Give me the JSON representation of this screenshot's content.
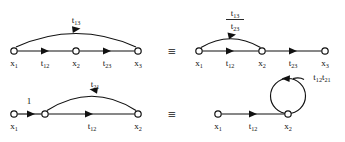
{
  "figure": {
    "background_color": "#ffffff",
    "line_color": "#111111",
    "equivalence_symbol": "≡"
  },
  "rows": [
    {
      "id": "row-top",
      "left_graph": {
        "id": "top-left-graph",
        "nodes": [
          {
            "id": "n1",
            "label_base": "x",
            "label_sub": "1",
            "cx": 14,
            "cy": 51
          },
          {
            "id": "n2",
            "label_base": "x",
            "label_sub": "2",
            "cx": 76,
            "cy": 51
          },
          {
            "id": "n3",
            "label_base": "x",
            "label_sub": "3",
            "cx": 138,
            "cy": 51
          }
        ],
        "edges": [
          {
            "id": "e-12",
            "kind": "straight",
            "label_base": "t",
            "label_sub": "12",
            "label_x": 45,
            "label_y": 66
          },
          {
            "id": "e-23",
            "kind": "straight",
            "label_base": "t",
            "label_sub": "23",
            "label_x": 107,
            "label_y": 66
          },
          {
            "id": "e-13",
            "kind": "arc",
            "label_base": "t",
            "label_sub": "13",
            "label_x": 76,
            "label_y": 23
          }
        ]
      },
      "equiv_x": 172,
      "equiv_y": 53,
      "right_graph": {
        "id": "top-right-graph",
        "nodes": [
          {
            "id": "n1",
            "label_base": "x",
            "label_sub": "1",
            "cx": 199,
            "cy": 51
          },
          {
            "id": "n2",
            "label_base": "x",
            "label_sub": "2",
            "cx": 262,
            "cy": 51
          },
          {
            "id": "n3",
            "label_base": "x",
            "label_sub": "3",
            "cx": 325,
            "cy": 51
          }
        ],
        "edges": [
          {
            "id": "e-12",
            "kind": "straight",
            "label_base": "t",
            "label_sub": "12",
            "label_x": 230,
            "label_y": 66
          },
          {
            "id": "e-23",
            "kind": "straight",
            "label_base": "t",
            "label_sub": "23",
            "label_x": 293,
            "label_y": 66
          }
        ],
        "fraction_label": {
          "id": "frac-t13-t23",
          "numerator_base": "t",
          "numerator_sub": "13",
          "denominator_base": "t",
          "denominator_sub": "23",
          "x": 235,
          "numerator_y": 16,
          "bar_y": 19,
          "denominator_y": 29
        }
      }
    },
    {
      "id": "row-bottom",
      "left_graph": {
        "id": "bottom-left-graph",
        "nodes": [
          {
            "id": "n1",
            "label_base": "x",
            "label_sub": "1",
            "cx": 14,
            "cy": 114
          },
          {
            "id": "nmid",
            "label_base": "",
            "label_sub": "",
            "cx": 45,
            "cy": 114
          },
          {
            "id": "n2",
            "label_base": "x",
            "label_sub": "2",
            "cx": 138,
            "cy": 114
          }
        ],
        "edges": [
          {
            "id": "e-unity",
            "kind": "straight",
            "label_base": "1",
            "label_sub": "",
            "label_x": 29,
            "label_y": 104
          },
          {
            "id": "e-12",
            "kind": "straight",
            "label_base": "t",
            "label_sub": "12",
            "label_x": 92,
            "label_y": 129
          },
          {
            "id": "e-21",
            "kind": "arc-reverse",
            "label_base": "t",
            "label_sub": "21",
            "label_x": 95,
            "label_y": 87
          }
        ]
      },
      "equiv_x": 172,
      "equiv_y": 116,
      "right_graph": {
        "id": "bottom-right-graph",
        "nodes": [
          {
            "id": "n1",
            "label_base": "x",
            "label_sub": "1",
            "cx": 218,
            "cy": 114
          },
          {
            "id": "n2",
            "label_base": "x",
            "label_sub": "2",
            "cx": 288,
            "cy": 114
          }
        ],
        "edges": [
          {
            "id": "e-12",
            "kind": "straight",
            "label_base": "t",
            "label_sub": "12",
            "label_x": 253,
            "label_y": 129
          }
        ],
        "self_loop": {
          "id": "self-loop-x2",
          "cx": 288,
          "cy": 96,
          "r": 17.5,
          "label_parts": [
            {
              "base": "t",
              "sub": "12"
            },
            {
              "base": "t",
              "sub": "21"
            }
          ],
          "label_x": 322,
          "label_y": 80
        }
      }
    }
  ]
}
